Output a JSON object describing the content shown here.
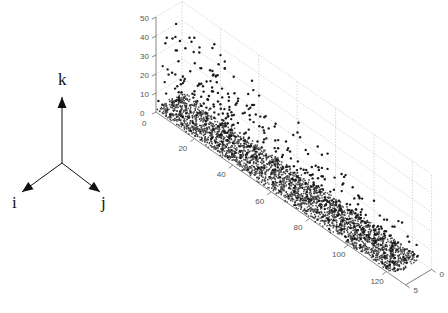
{
  "triad": {
    "labels": {
      "k": "k",
      "i": "i",
      "j": "j"
    },
    "origin": [
      62,
      163
    ],
    "k_tip": [
      62,
      97
    ],
    "i_tip": [
      22,
      192
    ],
    "j_tip": [
      100,
      192
    ],
    "label_pos": {
      "k": [
        58,
        85
      ],
      "i": [
        12,
        208
      ],
      "j": [
        101,
        208
      ]
    }
  },
  "chart_data": {
    "type": "scatter",
    "subtype": "scatter3d",
    "title": "",
    "xlabel": "",
    "ylabel": "",
    "zlabel": "",
    "x_axis": {
      "range": [
        0,
        130
      ],
      "ticks": [
        20,
        40,
        60,
        80,
        100,
        120
      ],
      "tick_labels": [
        "20",
        "40",
        "60",
        "80",
        "100",
        "120"
      ]
    },
    "y_axis": {
      "range": [
        0,
        5
      ],
      "ticks": [
        0,
        5
      ],
      "tick_labels": [
        "0",
        "5"
      ]
    },
    "z_axis": {
      "range": [
        0,
        50
      ],
      "ticks": [
        0,
        10,
        20,
        30,
        40,
        50
      ],
      "tick_labels": [
        "0",
        "10",
        "20",
        "30",
        "40",
        "50"
      ]
    },
    "extra_tick_labels": [
      "0",
      "0"
    ],
    "grid": true,
    "legend": null,
    "marker": {
      "color": "#1a1a1a",
      "size": 2.4
    },
    "distribution": {
      "dense_band_count": 2600,
      "dense_band_z_max": 3,
      "sparse_count": 520,
      "sparse_z_max_at_x0": 47,
      "sparse_z_max_at_xmax": 12
    }
  },
  "projection": {
    "origin_px": [
      156,
      112
    ],
    "x_unit_px": [
      1.92,
      1.33
    ],
    "y_unit_px": [
      5.2,
      -3.1
    ],
    "z_unit_px": [
      0,
      -1.9
    ]
  }
}
